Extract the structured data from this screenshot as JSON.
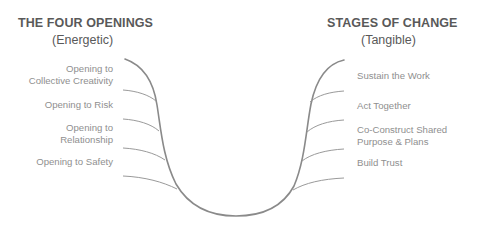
{
  "left_column": {
    "title": "THE FOUR OPENINGS",
    "subtitle": "(Energetic)",
    "items": [
      {
        "line1": "Opening to",
        "line2": "Collective Creativity"
      },
      {
        "line1": "Opening to Risk",
        "line2": ""
      },
      {
        "line1": "Opening to",
        "line2": "Relationship"
      },
      {
        "line1": "Opening to Safety",
        "line2": ""
      }
    ]
  },
  "right_column": {
    "title": "STAGES OF CHANGE",
    "subtitle": "(Tangible)",
    "items": [
      {
        "line1": "Sustain the Work",
        "line2": ""
      },
      {
        "line1": "Act Together",
        "line2": ""
      },
      {
        "line1": "Co-Construct Shared",
        "line2": "Purpose & Plans"
      },
      {
        "line1": "Build Trust",
        "line2": ""
      }
    ]
  },
  "colors": {
    "title": "#595959",
    "label": "#8f8f8f",
    "curve": "#8a8a8a",
    "ribs": "#9a9a9a"
  }
}
